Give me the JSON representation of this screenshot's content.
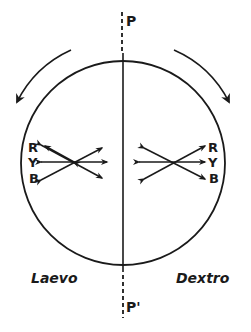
{
  "diagram": {
    "axis_top_label": "P",
    "axis_bottom_label": "P'",
    "left_label": "Laevo",
    "right_label": "Dextro",
    "left_colors": [
      "R",
      "Y",
      "B"
    ],
    "right_colors": [
      "R",
      "Y",
      "B"
    ],
    "rotation_left": "counterclockwise",
    "rotation_right": "clockwise",
    "stroke_color": "#1a1a1a"
  }
}
